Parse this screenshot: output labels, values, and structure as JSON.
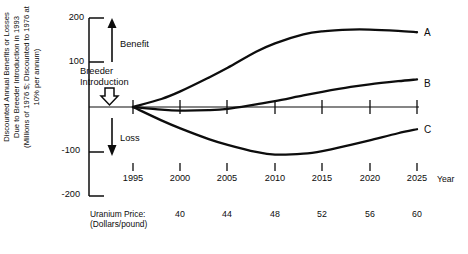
{
  "chart_data": {
    "type": "line",
    "title": "",
    "ylabel": "Discounted Annual Benefits or Losses Due to Breeder Introduction in 1993 (Millions of 1976 $; Discounted to 1976 at 10% per annum)",
    "ylabel_lines": [
      "Discounted Annual Benefits or Losses",
      "Due to Breeder Introduction in 1993",
      "(Millions of 1976 $; Discounted to 1976 at",
      "10% per annum)"
    ],
    "xlabel": "Year",
    "ylim": [
      -200,
      200
    ],
    "xlim": [
      1995,
      2025
    ],
    "yticks": [
      200,
      100,
      -100,
      -200
    ],
    "ytick_labels": [
      "200",
      "100",
      "-100",
      "-200"
    ],
    "xticks": [
      1995,
      2000,
      2005,
      2010,
      2015,
      2020,
      2025
    ],
    "xtick_labels": [
      "1995",
      "2000",
      "2005",
      "2010",
      "2015",
      "2020",
      "2025"
    ],
    "grid": false,
    "legend": "inline-end-labels",
    "x": [
      1995,
      1998,
      2000,
      2003,
      2005,
      2008,
      2010,
      2013,
      2015,
      2018,
      2020,
      2023,
      2025
    ],
    "series": [
      {
        "name": "A",
        "label": "A",
        "values": [
          0,
          18,
          35,
          66,
          88,
          124,
          143,
          163,
          170,
          174,
          174,
          171,
          168
        ]
      },
      {
        "name": "B",
        "label": "B",
        "values": [
          0,
          -6,
          -8,
          -7,
          -4,
          6,
          13,
          26,
          34,
          45,
          51,
          58,
          62
        ]
      },
      {
        "name": "C",
        "label": "C",
        "values": [
          0,
          -30,
          -48,
          -72,
          -85,
          -101,
          -107,
          -105,
          -99,
          -85,
          -75,
          -59,
          -50
        ]
      }
    ],
    "annotations": [
      {
        "name": "benefit",
        "text": "Benefit",
        "arrow": "up"
      },
      {
        "name": "loss",
        "text": "Loss",
        "arrow": "down"
      },
      {
        "name": "breeder-introduction",
        "text_lines": [
          "Breeder",
          "Introduction"
        ],
        "arrow": "down-hollow",
        "x": 1995
      }
    ],
    "secondary_axis": {
      "label_lines": [
        "Uranium Price:",
        "(Dollars/pound)"
      ],
      "label": "Uranium Price: (Dollars/pound)",
      "values": [
        "40",
        "44",
        "48",
        "52",
        "56",
        "60"
      ],
      "at_years": [
        2000,
        2005,
        2010,
        2015,
        2020,
        2025
      ]
    }
  },
  "colors": {
    "ink": "#0d0d0d",
    "background": "#ffffff"
  }
}
